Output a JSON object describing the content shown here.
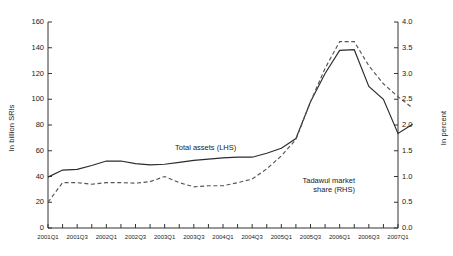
{
  "chart_data": {
    "type": "line",
    "title": "",
    "subtitle": "",
    "xlabel": "",
    "ylabel": "In billion SRls",
    "ylabel_right": "In percent",
    "ylim": [
      0,
      160
    ],
    "ylim_right": [
      0.0,
      4.0
    ],
    "yticks": [
      0,
      20,
      40,
      60,
      80,
      100,
      120,
      140,
      160
    ],
    "yticks_right": [
      "0.0",
      "0.5",
      "1.0",
      "1.5",
      "2.0",
      "2.5",
      "3.0",
      "3.5",
      "4.0"
    ],
    "grid": false,
    "legend_position": "in-plot annotations",
    "x": [
      "2001Q1",
      "2001Q2",
      "2001Q3",
      "2001Q4",
      "2002Q1",
      "2002Q2",
      "2002Q3",
      "2002Q4",
      "2003Q1",
      "2003Q2",
      "2003Q3",
      "2003Q4",
      "2004Q1",
      "2004Q2",
      "2004Q3",
      "2004Q4",
      "2005Q1",
      "2005Q2",
      "2005Q3",
      "2005Q4",
      "2006Q1",
      "2006Q2",
      "2006Q3",
      "2006Q4",
      "2007Q1"
    ],
    "xticklabels": [
      "2001Q1",
      "2001Q3",
      "2002Q1",
      "2002Q3",
      "2003Q1",
      "2003Q3",
      "2004Q1",
      "2004Q3",
      "2005Q1",
      "2005Q3",
      "2006Q1",
      "2006Q3",
      "2007Q1"
    ],
    "series": [
      {
        "name": "Total assets (LHS)",
        "axis": "left",
        "style": "solid",
        "color": "#2b2b2b",
        "units": "billion SRls",
        "values": [
          39.5,
          45.0,
          45.5,
          48.5,
          52.0,
          52.0,
          50.0,
          49.0,
          49.5,
          51.0,
          52.5,
          53.5,
          54.5,
          55.0,
          55.0,
          58.0,
          62.0,
          69.5,
          98.0,
          120.0,
          138.0,
          138.5,
          110.0,
          100.0,
          73.5
        ],
        "last_value": 80.5
      },
      {
        "name": "Tadawul market share (RHS)",
        "axis": "right",
        "style": "dashed",
        "color": "#555555",
        "units": "percent",
        "values": [
          0.5,
          0.88,
          0.88,
          0.85,
          0.88,
          0.88,
          0.87,
          0.9,
          1.0,
          0.88,
          0.8,
          0.82,
          0.82,
          0.88,
          0.95,
          1.15,
          1.4,
          1.72,
          2.45,
          3.1,
          3.62,
          3.62,
          3.15,
          2.8,
          2.55
        ],
        "last_value": 2.33
      }
    ],
    "annotations": [
      {
        "text": "Total assets (LHS)",
        "series": "Total assets (LHS)"
      },
      {
        "text_line1": "Tadawul market",
        "text_line2": "share (RHS)",
        "series": "Tadawul market share (RHS)"
      }
    ]
  },
  "annotations": {
    "total_assets": "Total assets (LHS)",
    "tadawul_line1": "Tadawul market",
    "tadawul_line2": "share (RHS)"
  },
  "axes": {
    "left_title": "In billion SRls",
    "right_title": "In percent"
  },
  "colors": {
    "background": "#ffffff",
    "axis": "#333333",
    "total_assets_line": "#2b2b2b",
    "tadawul_line": "#555555",
    "text": "#222222"
  }
}
